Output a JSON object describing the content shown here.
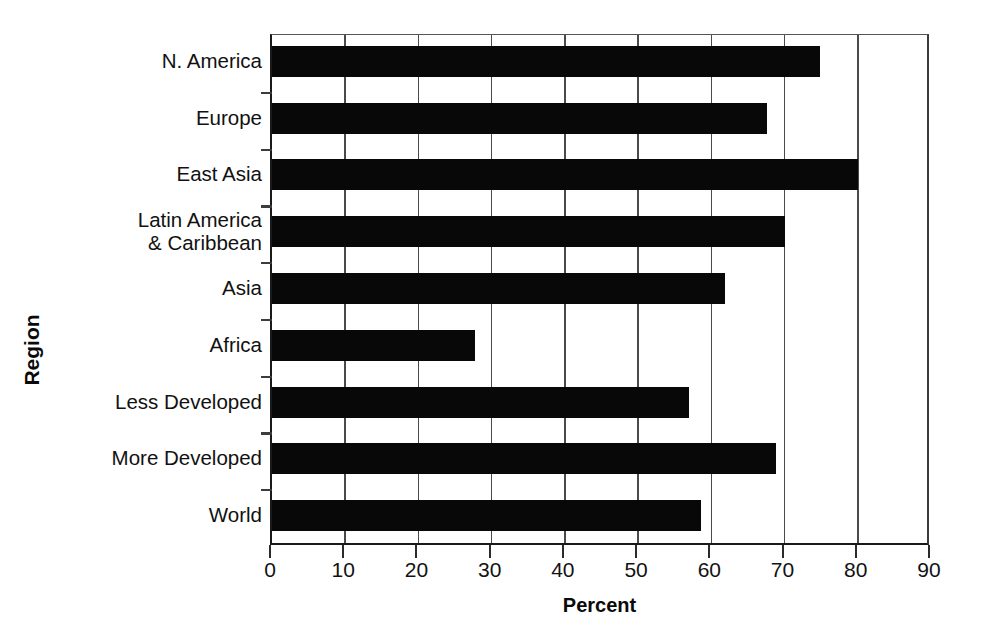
{
  "chart_data": {
    "type": "bar",
    "orientation": "horizontal",
    "title": "",
    "xlabel": "Percent",
    "ylabel": "Region",
    "categories": [
      "N. America",
      "Europe",
      "East Asia",
      "Latin America\n& Caribbean",
      "Asia",
      "Africa",
      "Less Developed",
      "More Developed",
      "World"
    ],
    "values": [
      74.9,
      67.6,
      80.0,
      70.0,
      61.8,
      27.7,
      57.0,
      68.8,
      58.6
    ],
    "xlim": [
      0,
      90
    ],
    "xticks": [
      0,
      10,
      20,
      30,
      40,
      50,
      60,
      70,
      80,
      90
    ],
    "xticklabels": [
      "0",
      "10",
      "20",
      "30",
      "40",
      "50",
      "60",
      "70",
      "80",
      "90"
    ],
    "grid": "vertical",
    "legend": "none",
    "bar_color": "#080808",
    "axis_color": "#1a1a1a",
    "gridline_color": "#4a4a4a",
    "background_color": "#ffffff"
  }
}
